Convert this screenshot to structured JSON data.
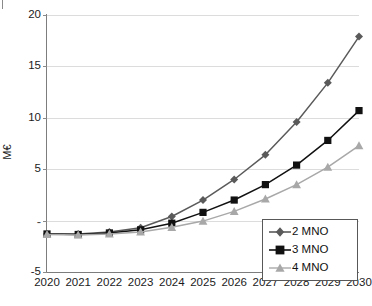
{
  "chart_data": {
    "type": "line",
    "title": "",
    "xlabel": "",
    "ylabel": "M€",
    "x": [
      2020,
      2021,
      2022,
      2023,
      2024,
      2025,
      2026,
      2027,
      2028,
      2029,
      2030
    ],
    "categories": [
      "2020",
      "2021",
      "2022",
      "2023",
      "2024",
      "2025",
      "2026",
      "2027",
      "2028",
      "2029",
      "2030"
    ],
    "ylim": [
      -5,
      20
    ],
    "yticks": [
      -5,
      0,
      5,
      10,
      15,
      20
    ],
    "ytick_labels": [
      "-5",
      "-",
      "5",
      "10",
      "15",
      "20"
    ],
    "grid": true,
    "legend_position": "bottom-right",
    "series": [
      {
        "name": "2 MNO",
        "marker": "diamond",
        "color": "#5a5a5a",
        "values": [
          -1.3,
          -1.3,
          -1.1,
          -0.7,
          0.4,
          2.0,
          4.0,
          6.4,
          9.6,
          13.4,
          17.9
        ]
      },
      {
        "name": "3 MNO",
        "marker": "square",
        "color": "#111111",
        "values": [
          -1.3,
          -1.35,
          -1.2,
          -0.9,
          -0.25,
          0.8,
          2.0,
          3.5,
          5.4,
          7.8,
          10.7
        ]
      },
      {
        "name": "4 MNO",
        "marker": "triangle",
        "color": "#a8a8a8",
        "values": [
          -1.35,
          -1.4,
          -1.3,
          -1.1,
          -0.65,
          -0.05,
          0.9,
          2.1,
          3.5,
          5.2,
          7.3
        ]
      }
    ]
  },
  "legend": {
    "items": [
      {
        "label": "2 MNO"
      },
      {
        "label": "3 MNO"
      },
      {
        "label": "4 MNO"
      }
    ]
  }
}
